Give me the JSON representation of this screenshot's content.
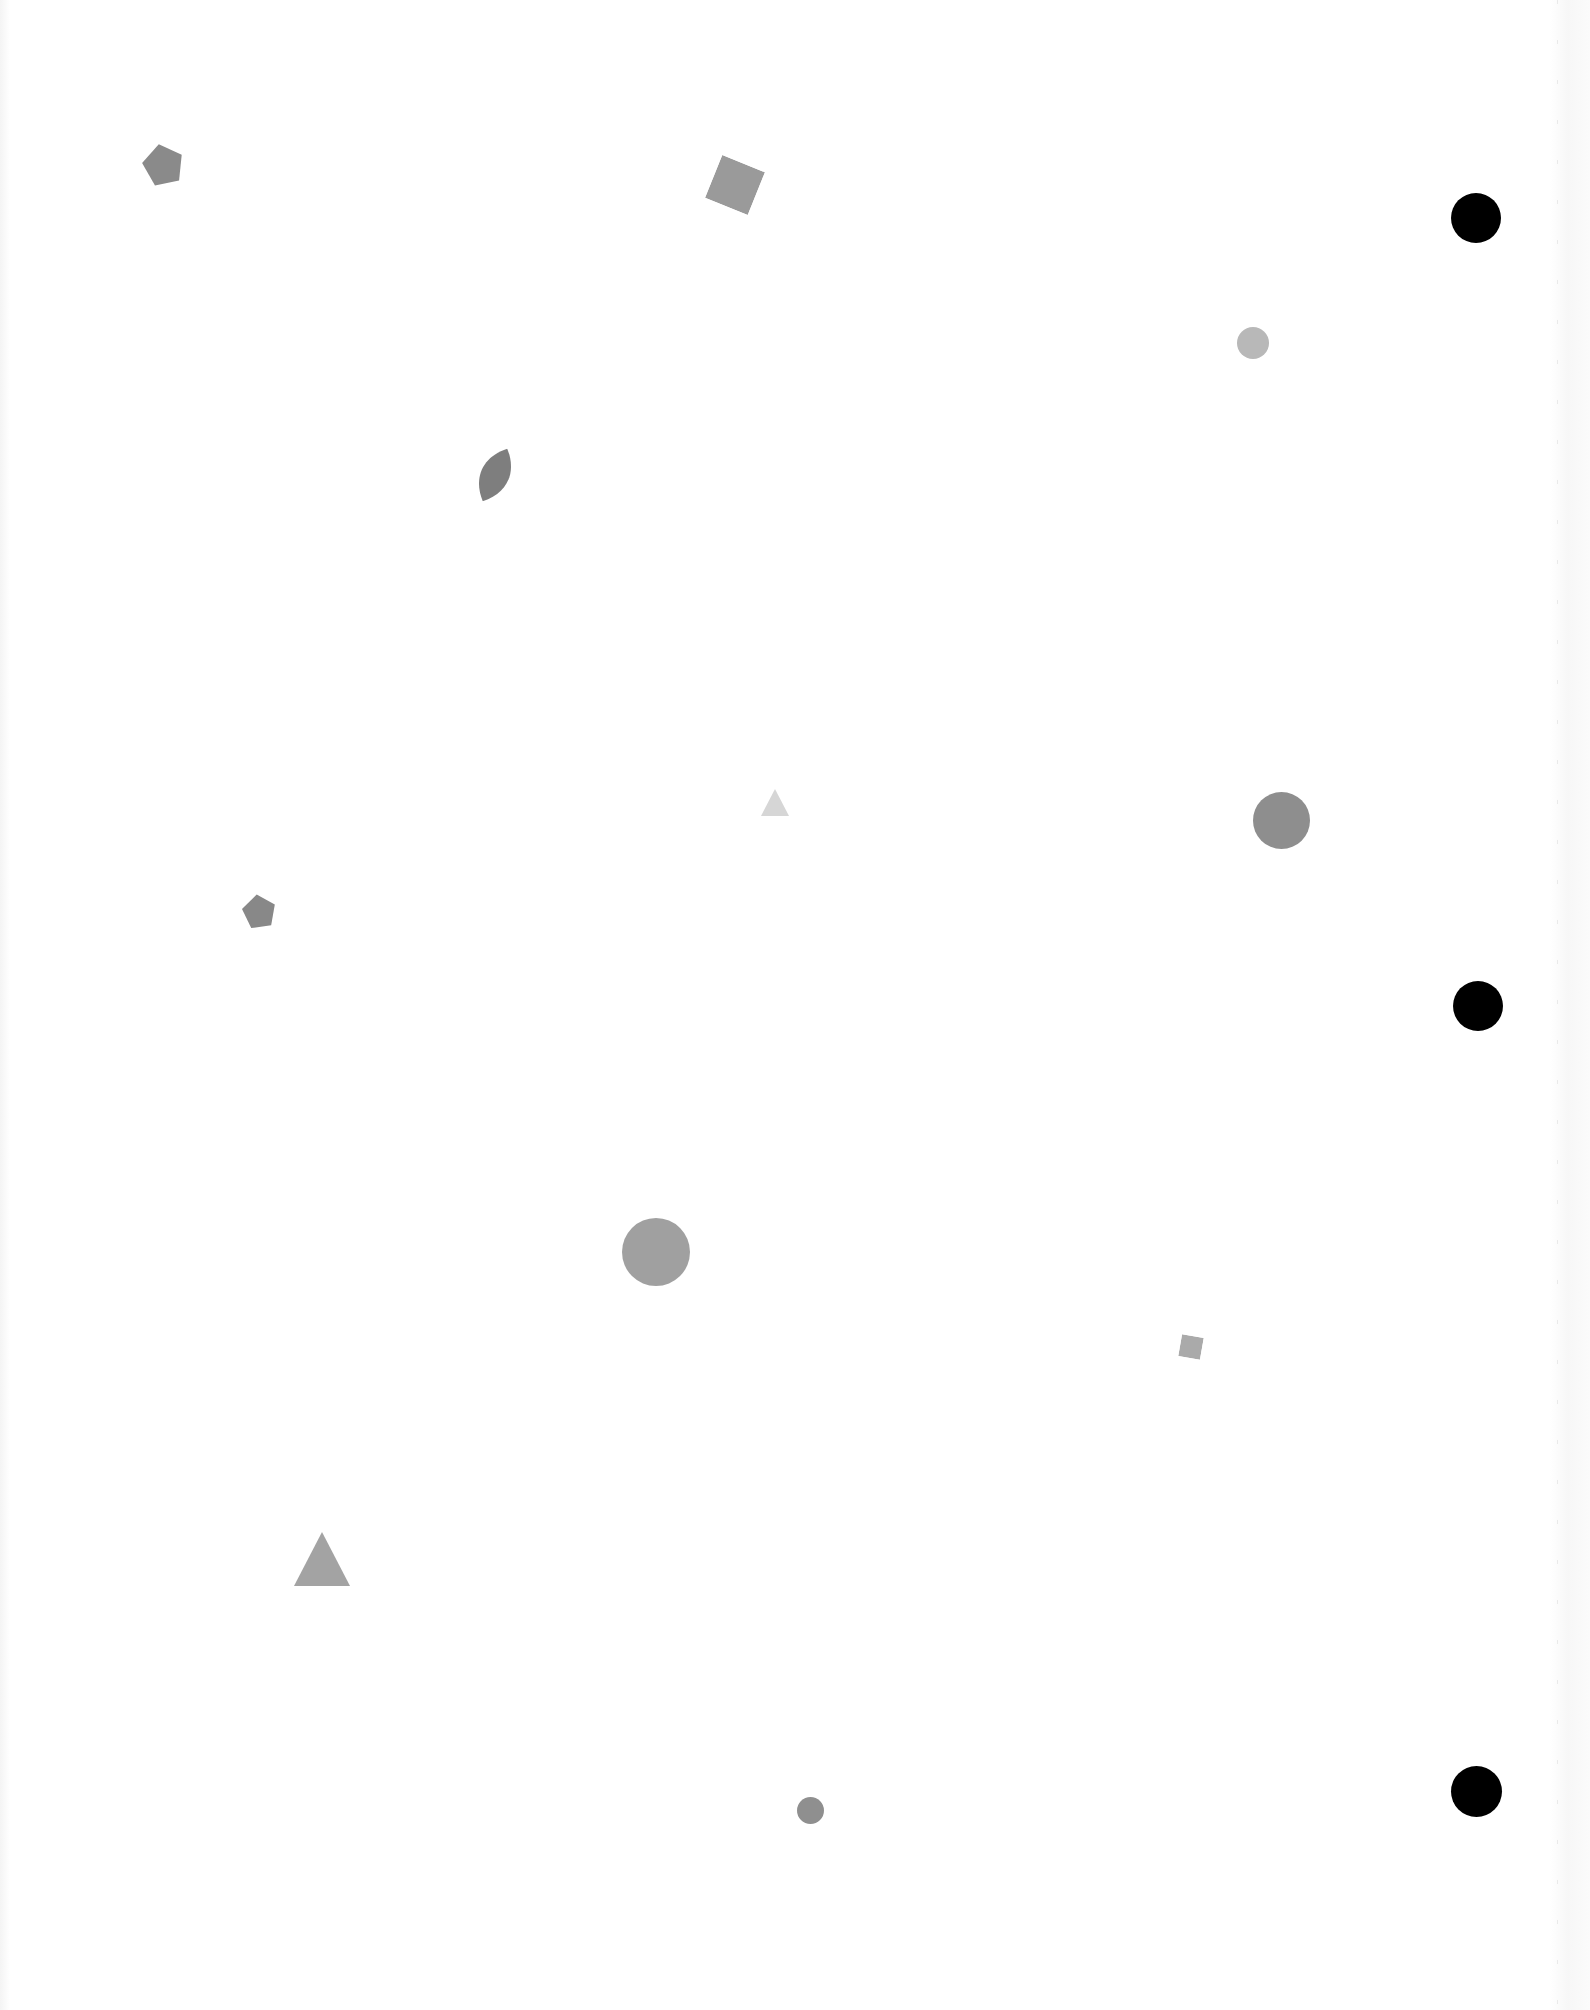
{
  "page": {
    "width": 1590,
    "height": 2010,
    "background": "#ffffff"
  },
  "shapes": [
    {
      "id": "pentagon-1",
      "type": "pentagon",
      "x": 141,
      "y": 142,
      "w": 44,
      "h": 44,
      "rotation": -12,
      "color": "#8a8a8a"
    },
    {
      "id": "square-1",
      "type": "square",
      "x": 712,
      "y": 162,
      "w": 46,
      "h": 46,
      "rotation": 22,
      "color": "#9a9a9a"
    },
    {
      "id": "circle-small-textured-1",
      "type": "circle",
      "x": 1237,
      "y": 327,
      "w": 32,
      "h": 32,
      "rotation": 0,
      "color": "#b8b8b8"
    },
    {
      "id": "leaf-1",
      "type": "leaf",
      "x": 474,
      "y": 446,
      "w": 42,
      "h": 58,
      "rotation": 25,
      "color": "#7e7e7e"
    },
    {
      "id": "triangle-small-1",
      "type": "triangle",
      "x": 761,
      "y": 789,
      "w": 28,
      "h": 27,
      "rotation": 0,
      "color": "#d6d6d6"
    },
    {
      "id": "circle-medium-1",
      "type": "circle",
      "x": 1253,
      "y": 792,
      "w": 57,
      "h": 57,
      "rotation": 0,
      "color": "#8e8e8e"
    },
    {
      "id": "pentagon-2",
      "type": "pentagon",
      "x": 241,
      "y": 893,
      "w": 36,
      "h": 36,
      "rotation": -8,
      "color": "#888888"
    },
    {
      "id": "circle-textured-1",
      "type": "circle",
      "x": 622,
      "y": 1218,
      "w": 68,
      "h": 68,
      "rotation": 0,
      "color": "#a0a0a0"
    },
    {
      "id": "square-small-1",
      "type": "square",
      "x": 1180,
      "y": 1336,
      "w": 22,
      "h": 22,
      "rotation": 10,
      "color": "#aaaaaa"
    },
    {
      "id": "triangle-large-1",
      "type": "triangle",
      "x": 294,
      "y": 1532,
      "w": 56,
      "h": 54,
      "rotation": 0,
      "color": "#a3a3a3"
    },
    {
      "id": "circle-small-1",
      "type": "circle",
      "x": 797,
      "y": 1797,
      "w": 27,
      "h": 27,
      "rotation": 0,
      "color": "#8f8f8f"
    }
  ],
  "punch_holes": [
    {
      "id": "punch-hole-top",
      "x": 1451,
      "y": 193,
      "d": 50,
      "color": "#000000"
    },
    {
      "id": "punch-hole-middle",
      "x": 1453,
      "y": 981,
      "d": 50,
      "color": "#000000"
    },
    {
      "id": "punch-hole-bottom",
      "x": 1451,
      "y": 1766,
      "d": 51,
      "color": "#000000"
    }
  ]
}
